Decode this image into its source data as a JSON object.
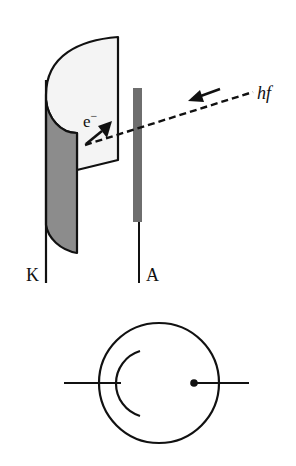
{
  "diagram": {
    "labels": {
      "cathode": "K",
      "anode": "A",
      "electron": "e",
      "electron_charge": "−",
      "photon": "hf"
    },
    "colors": {
      "cathode_inner": "#f4f4f4",
      "cathode_shadow": "#8c8c8c",
      "anode_bar": "#6e6e6e",
      "stroke": "#111111"
    },
    "elements": [
      {
        "name": "cathode",
        "shape": "curved half-cylinder plate"
      },
      {
        "name": "anode",
        "shape": "vertical rod"
      },
      {
        "name": "photon-ray",
        "shape": "dashed line with arrow toward cathode"
      },
      {
        "name": "electron-arrow",
        "shape": "arrow leaving cathode"
      },
      {
        "name": "circuit-symbol",
        "shape": "circle with curved cathode and dot anode"
      }
    ]
  }
}
